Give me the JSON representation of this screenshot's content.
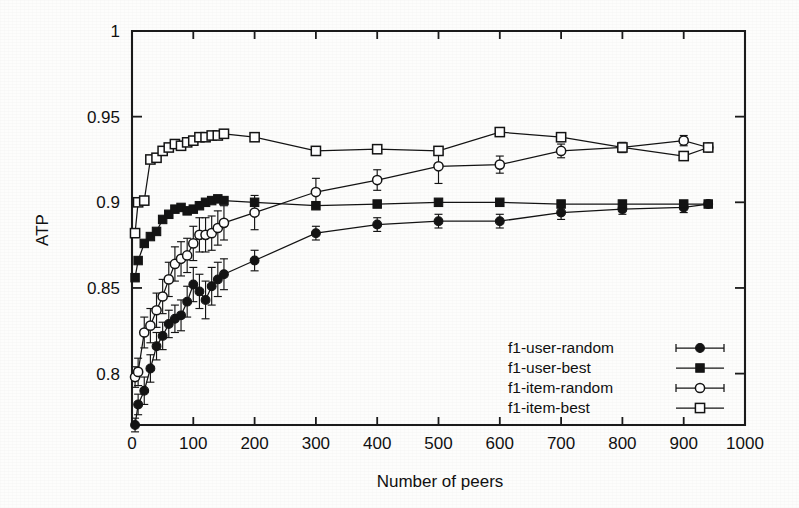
{
  "figure": {
    "background_color": "#fdfdfc",
    "ink_color": "#141414"
  },
  "chart_data": {
    "type": "line",
    "title": "",
    "xlabel": "Number of peers",
    "ylabel": "ATP",
    "xlim": [
      0,
      1000
    ],
    "ylim": [
      0.77,
      1.0
    ],
    "xticks": [
      0,
      100,
      200,
      300,
      400,
      500,
      600,
      700,
      800,
      900,
      1000
    ],
    "xticklabels": [
      "0",
      "100",
      "200",
      "300",
      "400",
      "500",
      "600",
      "700",
      "800",
      "900",
      "1000"
    ],
    "yticks": [
      0.8,
      0.85,
      0.9,
      0.95,
      1
    ],
    "yticklabels": [
      "0.8",
      "0.85",
      "0.9",
      "0.95",
      "1"
    ],
    "grid": false,
    "legend_position": "lower right",
    "error_bars": true,
    "series": [
      {
        "name": "f1-user-random",
        "marker": "filled-circle",
        "x": [
          5,
          10,
          20,
          30,
          40,
          50,
          60,
          70,
          80,
          90,
          100,
          110,
          120,
          130,
          140,
          150,
          200,
          300,
          400,
          500,
          600,
          700,
          800,
          900,
          940
        ],
        "y": [
          0.77,
          0.782,
          0.79,
          0.803,
          0.816,
          0.822,
          0.829,
          0.832,
          0.834,
          0.842,
          0.852,
          0.848,
          0.843,
          0.851,
          0.855,
          0.858,
          0.866,
          0.882,
          0.887,
          0.889,
          0.889,
          0.894,
          0.896,
          0.897,
          0.899
        ],
        "yerr": [
          0.004,
          0.006,
          0.008,
          0.008,
          0.008,
          0.008,
          0.008,
          0.008,
          0.009,
          0.009,
          0.01,
          0.01,
          0.011,
          0.011,
          0.01,
          0.009,
          0.006,
          0.004,
          0.004,
          0.004,
          0.004,
          0.004,
          0.003,
          0.003,
          0.002
        ]
      },
      {
        "name": "f1-user-best",
        "marker": "filled-square",
        "x": [
          5,
          10,
          20,
          30,
          40,
          50,
          60,
          70,
          80,
          90,
          100,
          110,
          120,
          130,
          140,
          150,
          200,
          300,
          400,
          500,
          600,
          700,
          800,
          900,
          940
        ],
        "y": [
          0.856,
          0.866,
          0.876,
          0.88,
          0.883,
          0.89,
          0.893,
          0.896,
          0.897,
          0.895,
          0.896,
          0.898,
          0.9,
          0.901,
          0.902,
          0.901,
          0.9,
          0.898,
          0.899,
          0.9,
          0.9,
          0.899,
          0.899,
          0.899,
          0.899
        ],
        "yerr": [
          0.001,
          0.001,
          0.001,
          0.001,
          0.001,
          0.001,
          0.001,
          0.001,
          0.001,
          0.001,
          0.001,
          0.001,
          0.001,
          0.001,
          0.001,
          0.001,
          0.001,
          0.001,
          0.001,
          0.001,
          0.001,
          0.001,
          0.001,
          0.001,
          0.001
        ]
      },
      {
        "name": "f1-item-random",
        "marker": "open-circle",
        "x": [
          5,
          10,
          20,
          30,
          40,
          50,
          60,
          70,
          80,
          90,
          100,
          110,
          120,
          130,
          140,
          150,
          200,
          300,
          400,
          500,
          600,
          700,
          800,
          900,
          940
        ],
        "y": [
          0.798,
          0.801,
          0.824,
          0.828,
          0.837,
          0.845,
          0.855,
          0.864,
          0.867,
          0.869,
          0.876,
          0.881,
          0.881,
          0.882,
          0.885,
          0.888,
          0.894,
          0.906,
          0.913,
          0.921,
          0.922,
          0.93,
          0.932,
          0.936,
          0.932
        ],
        "yerr": [
          0.006,
          0.008,
          0.009,
          0.01,
          0.01,
          0.01,
          0.01,
          0.01,
          0.01,
          0.01,
          0.01,
          0.01,
          0.01,
          0.01,
          0.01,
          0.01,
          0.01,
          0.008,
          0.006,
          0.01,
          0.005,
          0.004,
          0.003,
          0.003,
          0.002
        ]
      },
      {
        "name": "f1-item-best",
        "marker": "open-square",
        "x": [
          5,
          10,
          20,
          30,
          40,
          50,
          60,
          70,
          80,
          90,
          100,
          110,
          120,
          130,
          140,
          150,
          200,
          300,
          400,
          500,
          600,
          700,
          800,
          900,
          940
        ],
        "y": [
          0.882,
          0.9,
          0.901,
          0.925,
          0.926,
          0.93,
          0.932,
          0.934,
          0.933,
          0.935,
          0.936,
          0.938,
          0.938,
          0.939,
          0.939,
          0.94,
          0.938,
          0.93,
          0.931,
          0.93,
          0.941,
          0.938,
          0.932,
          0.927,
          0.932
        ],
        "yerr": [
          0.001,
          0.001,
          0.001,
          0.001,
          0.001,
          0.001,
          0.001,
          0.001,
          0.001,
          0.001,
          0.001,
          0.001,
          0.001,
          0.001,
          0.001,
          0.001,
          0.001,
          0.001,
          0.001,
          0.001,
          0.001,
          0.001,
          0.001,
          0.001,
          0.001
        ]
      }
    ]
  },
  "legend": {
    "entries": [
      {
        "label": "f1-user-random",
        "marker": "filled-circle"
      },
      {
        "label": "f1-user-best",
        "marker": "filled-square"
      },
      {
        "label": "f1-item-random",
        "marker": "open-circle"
      },
      {
        "label": "f1-item-best",
        "marker": "open-square"
      }
    ]
  }
}
